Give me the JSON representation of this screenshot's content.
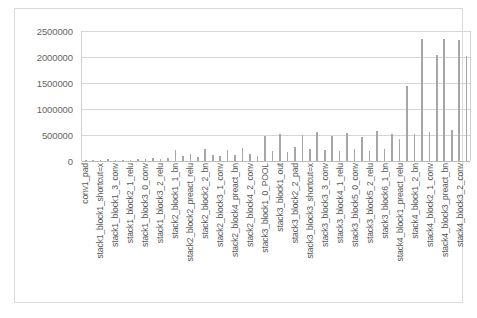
{
  "chart_data": {
    "type": "bar",
    "title": "",
    "xlabel": "",
    "ylabel": "",
    "ylim": [
      0,
      2500000
    ],
    "grid": true,
    "legend": false,
    "y_ticks": [
      2500000,
      2000000,
      1500000,
      1000000,
      500000,
      0
    ],
    "y_tick_labels": [
      "2500000",
      "2000000",
      "1500000",
      "1000000",
      "500000",
      "0"
    ],
    "bar_color": "#a6a6a6",
    "categories": [
      "conv1_pad",
      "conv1_conv",
      "stack1_block1_shortcut=x",
      "stack1_block1_1_conv",
      "stack1_block1_3_conv",
      "stack1_block2_0_conv",
      "stack1_block2_1_relu",
      "stack1_block2_2_conv",
      "stack1_block3_0_conv",
      "stack1_block3_1_conv",
      "stack1_block3_2_relu",
      "stack1_block3_3_conv",
      "stack2_block1_1_bn",
      "stack2_block1_2_conv",
      "stack2_block2_preact_relu",
      "stack2_block2_0_conv",
      "stack2_block2_2_bn",
      "stack2_block2_3_conv",
      "stack2_block3_1_conv",
      "stack2_block3_2_bn",
      "stack2_block4_preact_bn",
      "stack2_block4_0_conv",
      "stack2_block4_2_conv",
      "stack2_block4_3_bn",
      "stack3_block1_0_POOL",
      "stack3_block1_1_conv",
      "stack3_block1_out",
      "stack3_block2_0_bn",
      "stack3_block2_2_pad",
      "stack3_block2_3_conv",
      "stack3_block3_shortcut=x",
      "stack3_block3_1_bn",
      "stack3_block3_3_conv",
      "stack3_block3_out",
      "stack3_block4_1_relu",
      "stack3_block4_2_conv",
      "stack3_block5_0_conv",
      "stack3_block5_1_bn",
      "stack3_block5_2_relu",
      "stack3_block5_3_conv",
      "stack3_block6_1_bn",
      "stack3_block6_2_conv",
      "stack4_block1_preact_relu",
      "stack4_block1_0_conv",
      "stack4_block1_2_bn",
      "stack4_block1_3_conv",
      "stack4_block2_1_conv",
      "stack4_block2_2_bn",
      "stack4_block3_preact_bn",
      "stack4_block3_1_conv",
      "stack4_block3_2_conv",
      "stack4_block3_3_conv"
    ],
    "tick_labels": [
      "conv1_pad",
      "stack1_block1_shortcut=x",
      "stack1_block1_3_conv",
      "stack1_block2_1_relu",
      "stack1_block3_0_conv",
      "stack1_block3_2_relu",
      "stack2_block1_1_bn",
      "stack2_block2_preact_relu",
      "stack2_block2_2_bn",
      "stack2_block3_1_conv",
      "stack2_block4_preact_bn",
      "stack2_block4_2_conv",
      "stack3_block1_0_POOL",
      "stack3_block1_out",
      "stack3_block2_2_pad",
      "stack3_block3_shortcut=x",
      "stack3_block3_3_conv",
      "stack3_block4_1_relu",
      "stack3_block5_0_conv",
      "stack3_block5_2_relu",
      "stack3_block6_1_bn",
      "stack4_block1_preact_relu",
      "stack4_block1_2_bn",
      "stack4_block2_1_conv",
      "stack4_block3_preact_bn",
      "stack4_block3_2_conv"
    ],
    "values": [
      8000,
      20000,
      12000,
      30000,
      25000,
      18000,
      22000,
      40000,
      35000,
      60000,
      48000,
      55000,
      210000,
      95000,
      140000,
      80000,
      230000,
      120000,
      90000,
      205000,
      115000,
      250000,
      130000,
      100000,
      480000,
      200000,
      520000,
      180000,
      260000,
      500000,
      230000,
      560000,
      210000,
      490000,
      185000,
      540000,
      240000,
      470000,
      200000,
      580000,
      230000,
      520000,
      420000,
      1450000,
      520000,
      2350000,
      560000,
      2030000,
      2340000,
      600000,
      2330000,
      2020000
    ],
    "series_name": "layer_size"
  }
}
